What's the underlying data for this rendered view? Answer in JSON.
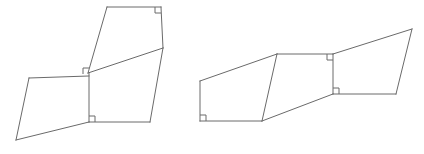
{
  "canvas": {
    "width": 424,
    "height": 154,
    "background": "#ffffff",
    "stroke_color": "#6a6a6a",
    "stroke_width": 1
  },
  "figure": {
    "shape_count": 2,
    "right_angle_marks_total": 7
  },
  "shapes": [
    {
      "name": "left-composite-figure",
      "label": "Left figure",
      "parts": [
        {
          "name": "left-lower-left-quad",
          "label": "Lower-left quadrilateral",
          "points": "29,78 89,75 89,122 16,140"
        },
        {
          "name": "left-upper-quad",
          "label": "Upper quadrilateral",
          "points": "107,7 161,7 163,48 88,73"
        },
        {
          "name": "left-lower-right-quad",
          "label": "Lower-right quadrilateral",
          "points": "88,73 163,48 150,122 89,122"
        }
      ],
      "edges": [
        {
          "name": "left-edge-top-upper",
          "points": "107,7 161,7"
        },
        {
          "name": "left-edge-right-upper",
          "points": "161,7 163,48"
        },
        {
          "name": "left-edge-diagonal-mid",
          "points": "163,48 88,73"
        },
        {
          "name": "left-edge-left-upper",
          "points": "88,73 107,7"
        },
        {
          "name": "left-edge-right-lower",
          "points": "163,48 150,122"
        },
        {
          "name": "left-edge-bottom-lower-right",
          "points": "150,122 89,122"
        },
        {
          "name": "left-edge-vertical-center",
          "points": "89,73 89,122"
        },
        {
          "name": "left-edge-top-lower-left",
          "points": "29,78 89,76"
        },
        {
          "name": "left-edge-left-lower-left",
          "points": "29,78 16,140"
        },
        {
          "name": "left-edge-bottom-diagonal",
          "points": "16,140 89,122"
        }
      ],
      "right_angle_marks": [
        {
          "name": "right-angle-mark-upper-right",
          "x": 161,
          "y": 7,
          "dx": -1,
          "dy": 1,
          "size": 6
        },
        {
          "name": "right-angle-mark-center-upper",
          "x": 89,
          "y": 74,
          "dx": -1,
          "dy": -1,
          "size": 6
        },
        {
          "name": "right-angle-mark-center-lower",
          "x": 89,
          "y": 122,
          "dx": 1,
          "dy": -1,
          "size": 6
        }
      ]
    },
    {
      "name": "right-composite-figure",
      "label": "Right figure",
      "parts": [
        {
          "name": "right-left-quad",
          "label": "Left quadrilateral",
          "points": "200,81 277,54 262,121 200,121"
        },
        {
          "name": "right-middle-quad",
          "label": "Middle quadrilateral",
          "points": "277,54 333,54 333,94 262,121"
        },
        {
          "name": "right-right-quad",
          "label": "Right quadrilateral",
          "points": "333,54 412,29 396,94 333,94"
        }
      ],
      "edges": [
        {
          "name": "right-edge-left-slant",
          "points": "200,81 277,54"
        },
        {
          "name": "right-edge-left-vertical",
          "points": "200,81 200,121"
        },
        {
          "name": "right-edge-bottom-left",
          "points": "200,121 262,121"
        },
        {
          "name": "right-edge-inner-diagonal",
          "points": "277,54 262,121"
        },
        {
          "name": "right-edge-middle-top",
          "points": "277,54 333,54"
        },
        {
          "name": "right-edge-middle-vertical",
          "points": "333,54 333,94"
        },
        {
          "name": "right-edge-bottom-diagonal",
          "points": "262,121 333,94"
        },
        {
          "name": "right-edge-upper-slant",
          "points": "333,54 412,29"
        },
        {
          "name": "right-edge-far-right",
          "points": "412,29 396,94"
        },
        {
          "name": "right-edge-bottom-right",
          "points": "396,94 333,94"
        }
      ],
      "right_angle_marks": [
        {
          "name": "right-angle-mark-bottom-left",
          "x": 200,
          "y": 121,
          "dx": 1,
          "dy": -1,
          "size": 6
        },
        {
          "name": "right-angle-mark-middle-top",
          "x": 333,
          "y": 54,
          "dx": -1,
          "dy": 1,
          "size": 6
        },
        {
          "name": "right-angle-mark-middle-bottom",
          "x": 333,
          "y": 94,
          "dx": 1,
          "dy": -1,
          "size": 6
        }
      ]
    }
  ]
}
